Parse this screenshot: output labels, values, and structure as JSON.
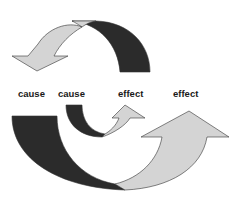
{
  "diagram": {
    "labels": [
      {
        "text": "cause",
        "x": 18
      },
      {
        "text": "cause",
        "x": 58
      },
      {
        "text": "effect",
        "x": 118
      },
      {
        "text": "effect",
        "x": 173
      }
    ],
    "arrows": [
      {
        "name": "top-curved-arrow",
        "direction": "down-left",
        "from": "effect",
        "to": "cause"
      },
      {
        "name": "small-curved-arrow",
        "direction": "up-right",
        "from": "cause",
        "to": "effect"
      },
      {
        "name": "large-curved-arrow",
        "direction": "up-right",
        "from": "cause",
        "to": "effect"
      }
    ],
    "colors": {
      "dark": "#2b2b2b",
      "light": "#d4d4d4",
      "stroke": "#333333",
      "text": "#1a1a1a"
    }
  }
}
